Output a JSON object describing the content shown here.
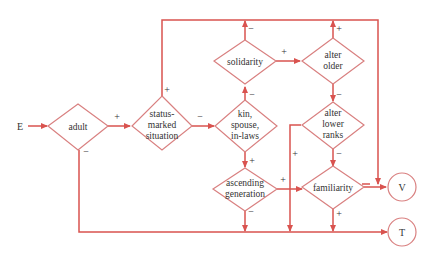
{
  "diagram": {
    "title": "",
    "colors": {
      "line": "#d9534f",
      "node_stroke": "#d98080",
      "text": "#333333",
      "background": "#ffffff"
    },
    "entry": {
      "label": "E"
    },
    "nodes": {
      "adult": {
        "lines": [
          "adult"
        ]
      },
      "status": {
        "lines": [
          "status-",
          "marked",
          "situation"
        ]
      },
      "kin": {
        "lines": [
          "kin,",
          "spouse,",
          "in-laws"
        ]
      },
      "solidarity": {
        "lines": [
          "solidarity"
        ]
      },
      "alter_older": {
        "lines": [
          "alter",
          "older"
        ]
      },
      "alter_lower": {
        "lines": [
          "alter",
          "lower",
          "ranks"
        ]
      },
      "ascending": {
        "lines": [
          "ascending",
          "generation"
        ]
      },
      "familiarity": {
        "lines": [
          "familiarity"
        ]
      }
    },
    "terminals": {
      "V": {
        "label": "V"
      },
      "T": {
        "label": "T"
      }
    },
    "edges": [
      {
        "from": "E",
        "to": "adult",
        "sign": ""
      },
      {
        "from": "adult",
        "to": "status",
        "sign": "+"
      },
      {
        "from": "adult",
        "to": "T",
        "sign": "−"
      },
      {
        "from": "status",
        "to": "kin",
        "sign": "−"
      },
      {
        "from": "status",
        "to": "V",
        "sign": "+"
      },
      {
        "from": "kin",
        "to": "solidarity",
        "sign": "−"
      },
      {
        "from": "kin",
        "to": "ascending",
        "sign": "+"
      },
      {
        "from": "solidarity",
        "to": "alter_older",
        "sign": "+"
      },
      {
        "from": "solidarity",
        "to": "V",
        "sign": "−"
      },
      {
        "from": "alter_older",
        "to": "V",
        "sign": "+"
      },
      {
        "from": "alter_older",
        "to": "alter_lower",
        "sign": "−"
      },
      {
        "from": "alter_lower",
        "to": "T",
        "sign": "+"
      },
      {
        "from": "alter_lower",
        "to": "familiarity",
        "sign": "−"
      },
      {
        "from": "ascending",
        "to": "familiarity",
        "sign": "+"
      },
      {
        "from": "ascending",
        "to": "T",
        "sign": "−"
      },
      {
        "from": "familiarity",
        "to": "V",
        "sign": ""
      },
      {
        "from": "familiarity",
        "to": "T",
        "sign": "+"
      }
    ],
    "signs": {
      "adult_plus": "+",
      "adult_minus": "−",
      "status_plus": "+",
      "status_minus": "−",
      "kin_minus": "−",
      "kin_plus": "+",
      "solidarity_plus": "+",
      "solidarity_minus": "−",
      "older_plus": "+",
      "older_minus": "−",
      "lower_plus": "+",
      "lower_minus": "−",
      "ascending_plus": "+",
      "ascending_minus": "−",
      "familiarity_plus": "+"
    }
  }
}
